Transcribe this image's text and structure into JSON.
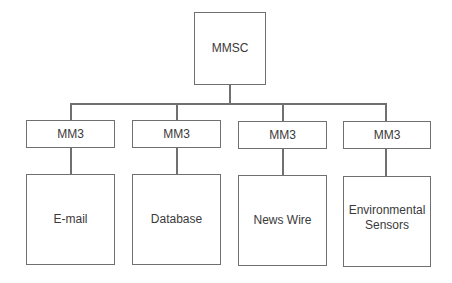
{
  "diagram": {
    "type": "hierarchy",
    "root": {
      "label": "MMSC"
    },
    "interfaces": [
      {
        "label": "MM3"
      },
      {
        "label": "MM3"
      },
      {
        "label": "MM3"
      },
      {
        "label": "MM3"
      }
    ],
    "sources": [
      {
        "label": "E-mail"
      },
      {
        "label": "Database"
      },
      {
        "label": "News Wire"
      },
      {
        "label": "Environmental\nSensors"
      }
    ],
    "colors": {
      "stroke": "#707070",
      "text": "#3a3a3a",
      "background": "#ffffff"
    }
  }
}
